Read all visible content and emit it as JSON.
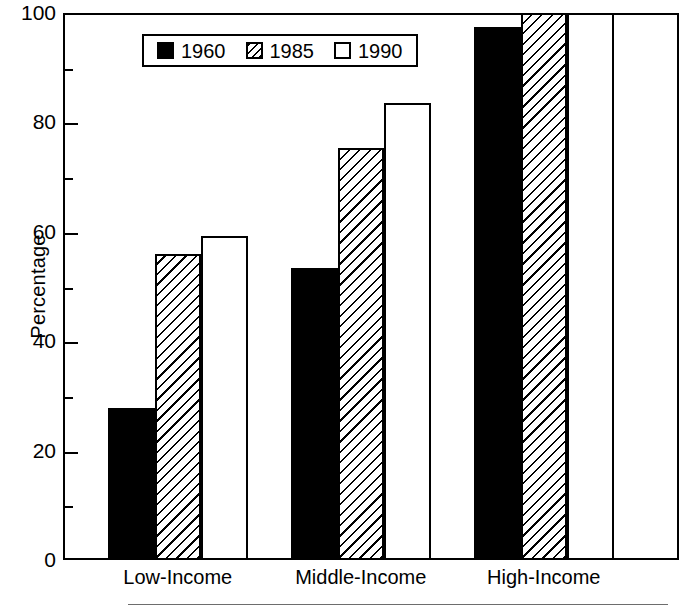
{
  "chart_data": {
    "type": "bar",
    "title": "",
    "subtitle": "",
    "xlabel": "",
    "ylabel": "Percentage",
    "ylim": [
      0,
      100
    ],
    "grid": false,
    "legend_position": "top-center",
    "categories": [
      "Low-Income",
      "Middle-Income",
      "High-Income"
    ],
    "y_ticks_major": [
      0,
      20,
      40,
      60,
      80,
      100
    ],
    "y_ticks_minor": [
      10,
      30,
      50,
      70,
      90
    ],
    "series": [
      {
        "name": "1960",
        "fill": "solid",
        "values": [
          27.8,
          53.4,
          97.4
        ]
      },
      {
        "name": "1985",
        "fill": "hatch",
        "values": [
          56.0,
          75.4,
          100.0
        ]
      },
      {
        "name": "1990",
        "fill": "empty",
        "values": [
          59.2,
          83.5,
          100.0
        ]
      }
    ]
  },
  "legend": {
    "entries": [
      {
        "label": "1960",
        "fill": "solid"
      },
      {
        "label": "1985",
        "fill": "hatch"
      },
      {
        "label": "1990",
        "fill": "empty"
      }
    ]
  },
  "axis": {
    "y_title": "Percentage",
    "y_tick_labels": [
      "100",
      "80",
      "60",
      "40",
      "20",
      "0"
    ],
    "x_tick_labels": [
      "Low-Income",
      "Middle-Income",
      "High-Income"
    ]
  },
  "colors": {
    "ink": "#000000",
    "paper": "#ffffff",
    "rule": "#6d6d6d"
  }
}
